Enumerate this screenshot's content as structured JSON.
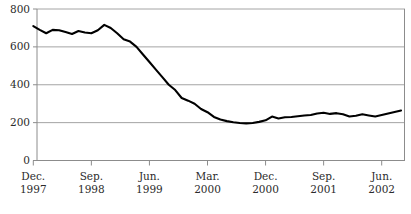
{
  "chart_data": {
    "type": "line",
    "title": "",
    "xlabel": "",
    "ylabel": "",
    "ylim": [
      0,
      800
    ],
    "yticks": [
      0,
      200,
      400,
      600,
      800
    ],
    "ytick_labels": [
      "0",
      "200",
      "400",
      "600",
      "800"
    ],
    "grid": true,
    "grid_axis": "y",
    "legend": "none",
    "line_color": "#000000",
    "grid_color": "#9a9a9a",
    "axis_color": "#8c8c8c",
    "x_tick_labels": [
      {
        "month": "Dec.",
        "year": "1997"
      },
      {
        "month": "Sep.",
        "year": "1998"
      },
      {
        "month": "Jun.",
        "year": "1999"
      },
      {
        "month": "Mar.",
        "year": "2000"
      },
      {
        "month": "Dec.",
        "year": "2000"
      },
      {
        "month": "Sep.",
        "year": "2001"
      },
      {
        "month": "Jun.",
        "year": "2002"
      }
    ],
    "x_tick_indices": [
      0,
      9,
      18,
      27,
      36,
      45,
      54
    ],
    "x_start": "Dec. 1997",
    "x_interval": "monthly",
    "x": [
      "Dec. 1997",
      "Jan. 1998",
      "Feb. 1998",
      "Mar. 1998",
      "Apr. 1998",
      "May 1998",
      "Jun. 1998",
      "Jul. 1998",
      "Aug. 1998",
      "Sep. 1998",
      "Oct. 1998",
      "Nov. 1998",
      "Dec. 1998",
      "Jan. 1999",
      "Feb. 1999",
      "Mar. 1999",
      "Apr. 1999",
      "May 1999",
      "Jun. 1999",
      "Jul. 1999",
      "Aug. 1999",
      "Sep. 1999",
      "Oct. 1999",
      "Nov. 1999",
      "Dec. 1999",
      "Jan. 2000",
      "Feb. 2000",
      "Mar. 2000",
      "Apr. 2000",
      "May 2000",
      "Jun. 2000",
      "Jul. 2000",
      "Aug. 2000",
      "Sep. 2000",
      "Oct. 2000",
      "Nov. 2000",
      "Dec. 2000",
      "Jan. 2001",
      "Feb. 2001",
      "Mar. 2001",
      "Apr. 2001",
      "May 2001",
      "Jun. 2001",
      "Jul. 2001",
      "Aug. 2001",
      "Sep. 2001",
      "Oct. 2001",
      "Nov. 2001",
      "Dec. 2001",
      "Jan. 2002",
      "Feb. 2002",
      "Mar. 2002",
      "Apr. 2002",
      "May 2002",
      "Jun. 2002",
      "Jul. 2002",
      "Aug. 2002",
      "Sep. 2002"
    ],
    "values": [
      710,
      690,
      672,
      690,
      688,
      678,
      668,
      684,
      676,
      672,
      688,
      716,
      700,
      672,
      640,
      628,
      600,
      560,
      520,
      480,
      440,
      400,
      372,
      330,
      316,
      300,
      272,
      255,
      230,
      216,
      208,
      202,
      198,
      196,
      198,
      204,
      212,
      232,
      222,
      228,
      230,
      234,
      238,
      240,
      248,
      252,
      246,
      250,
      244,
      232,
      236,
      244,
      238,
      232,
      240,
      248,
      256,
      264
    ]
  }
}
